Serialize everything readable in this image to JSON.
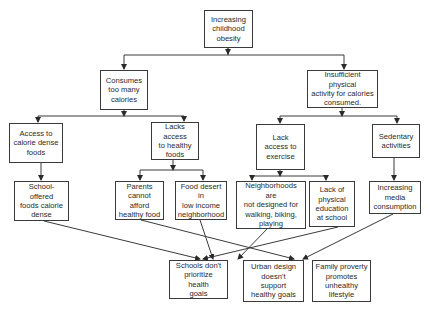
{
  "diagram": {
    "type": "cause-tree",
    "nodes": {
      "root": {
        "label": "Increasing\nchildhood\nobesity"
      },
      "calories": {
        "label": "Consumes\ntoo many\ncalories"
      },
      "activity": {
        "label": "Insufficient physical\nactivity for calories\nconsumed."
      },
      "dense_access": {
        "label": "Access to\ncalorie dense\nfoods"
      },
      "healthy_lack": {
        "label": "Lacks access\nto healthy\nfoods"
      },
      "exercise_lack": {
        "label": "Lack\naccess to\nexercise"
      },
      "sedentary": {
        "label": "Sedentary\nactivities"
      },
      "school_foods": {
        "label": "School-offered\nfoods calorie\ndense"
      },
      "parents": {
        "label": "Parents\ncannot afford\nhealthy food"
      },
      "food_desert": {
        "label": "Food desert in\nlow income\nneighborhood"
      },
      "neighborhoods": {
        "label": "Neighborhoods are\nnot designed for\nwalking, biking,\nplaying"
      },
      "phys_ed": {
        "label": "Lack of\nphysical\neducation\nat school"
      },
      "media": {
        "label": "Increasing\nmedia\nconsumption"
      },
      "schools_goals": {
        "label": "Schools don't\nprioritize\nhealth\ngoals"
      },
      "urban_design": {
        "label": "Urban design\ndoesn't\nsupport\nhealthy goals"
      },
      "family_poverty": {
        "label": "Family proverty\npromotes\nunhealthy\nlifestyle"
      }
    },
    "edges": [
      {
        "from": "root",
        "to": "calories"
      },
      {
        "from": "root",
        "to": "activity"
      },
      {
        "from": "calories",
        "to": "dense_access"
      },
      {
        "from": "calories",
        "to": "healthy_lack"
      },
      {
        "from": "activity",
        "to": "exercise_lack"
      },
      {
        "from": "activity",
        "to": "sedentary"
      },
      {
        "from": "dense_access",
        "to": "school_foods"
      },
      {
        "from": "healthy_lack",
        "to": "parents"
      },
      {
        "from": "healthy_lack",
        "to": "food_desert"
      },
      {
        "from": "exercise_lack",
        "to": "neighborhoods"
      },
      {
        "from": "exercise_lack",
        "to": "phys_ed"
      },
      {
        "from": "sedentary",
        "to": "media"
      },
      {
        "from": "school_foods",
        "to": "schools_goals"
      },
      {
        "from": "phys_ed",
        "to": "schools_goals"
      },
      {
        "from": "food_desert",
        "to": "urban_design"
      },
      {
        "from": "neighborhoods",
        "to": "urban_design"
      },
      {
        "from": "parents",
        "to": "family_poverty"
      },
      {
        "from": "media",
        "to": "family_poverty"
      }
    ],
    "colors": {
      "line": "#3a3a3a",
      "text": "#2a2a2a",
      "background": "#ffffff"
    }
  }
}
